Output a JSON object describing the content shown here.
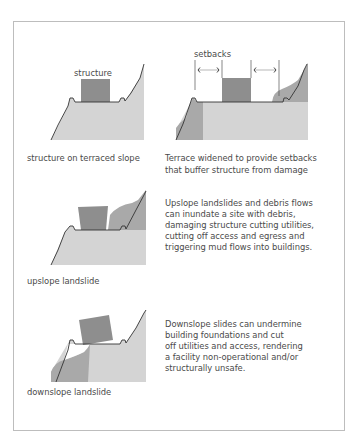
{
  "figure": {
    "panels": [
      {
        "id": "terraced",
        "diagram_label": "structure",
        "caption": "structure on terraced slope"
      },
      {
        "id": "setbacks",
        "diagram_label": "setbacks",
        "caption_lines": [
          "Terrace widened to provide setbacks",
          "that buffer structure from damage"
        ]
      },
      {
        "id": "upslope",
        "caption": "upslope landslide",
        "description_lines": [
          "Upslope landslides and debris flows",
          "can inundate a site with debris,",
          "damaging structure cutting utilities,",
          "cutting off access and egress and",
          "triggering mud flows into buildings."
        ]
      },
      {
        "id": "downslope",
        "caption": "downslope landslide",
        "description_lines": [
          "Downslope slides can undermine",
          "building foundations and cut",
          "off utilities and access, rendering",
          "a facility non-operational and/or",
          "structurally unsafe."
        ]
      }
    ],
    "colors": {
      "terrain": "#d4d4d4",
      "landslide": "#a9a9a9",
      "structure": "#8e8e8e",
      "outline": "#333333",
      "frame": "#bdbdbd",
      "text": "#4a4a4a"
    }
  }
}
